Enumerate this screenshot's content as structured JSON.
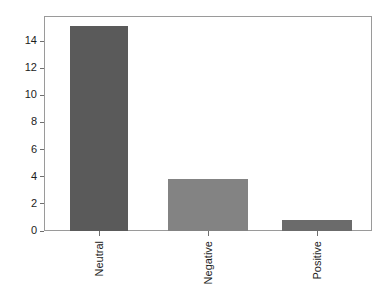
{
  "chart_data": {
    "type": "bar",
    "title": "",
    "subtitle": "",
    "xlabel": "",
    "ylabel": "",
    "categories": [
      "Neutral",
      "Negative",
      "Positive"
    ],
    "values": [
      15.1,
      3.85,
      0.78
    ],
    "series": [
      {
        "name": "Count",
        "values": [
          15.1,
          3.85,
          0.78
        ]
      }
    ],
    "bar_colors": [
      "#5a5a5a",
      "#838383",
      "#6b6b6b"
    ],
    "ylim": [
      0,
      15.85
    ],
    "xlim": [
      0,
      3
    ],
    "y_ticks": [
      0,
      2,
      4,
      6,
      8,
      10,
      12,
      14
    ],
    "y_tick_labels": [
      "0",
      "2",
      "4",
      "6",
      "8",
      "10",
      "12",
      "14"
    ],
    "x_tick_labels": [
      "Neutral",
      "Negative",
      "Positive"
    ],
    "x_tick_label_rotation": 90,
    "grid": false,
    "legend": false,
    "legend_position": "none",
    "frame": true,
    "annotations": []
  },
  "axes": {
    "y_ticks": [
      {
        "label": "14",
        "value": 14
      },
      {
        "label": "12",
        "value": 12
      },
      {
        "label": "10",
        "value": 10
      },
      {
        "label": "8",
        "value": 8
      },
      {
        "label": "6",
        "value": 6
      },
      {
        "label": "4",
        "value": 4
      },
      {
        "label": "2",
        "value": 2
      },
      {
        "label": "0",
        "value": 0
      }
    ],
    "x_ticks": [
      {
        "label": "Neutral"
      },
      {
        "label": "Negative"
      },
      {
        "label": "Positive"
      }
    ]
  },
  "bars": [
    {
      "label": "Neutral",
      "value": 15.1,
      "color": "#5a5a5a"
    },
    {
      "label": "Negative",
      "value": 3.85,
      "color": "#838383"
    },
    {
      "label": "Positive",
      "value": 0.78,
      "color": "#6b6b6b"
    }
  ],
  "style": {
    "frame_color": "#9a9a9a",
    "tick_color": "#6f6f6f",
    "text_color": "#1c1c1c",
    "background": "#ffffff"
  }
}
